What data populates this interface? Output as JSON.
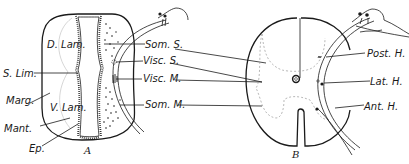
{
  "figure": {
    "panel_a": {
      "caption": "A",
      "labels": {
        "d_lam": "D. Lam.",
        "s_lim": "S. Lim.",
        "marg": "Marg.",
        "v_lam": "V. Lam.",
        "mant": "Mant.",
        "ep": "Ep.",
        "som_s": "Som. S.",
        "visc_s": "Visc. S.",
        "visc_m": "Visc. M.",
        "som_m": "Som. M."
      }
    },
    "panel_b": {
      "caption": "B",
      "labels": {
        "post_h": "Post. H.",
        "lat_h": "Lat. H.",
        "ant_h": "Ant. H."
      }
    }
  }
}
